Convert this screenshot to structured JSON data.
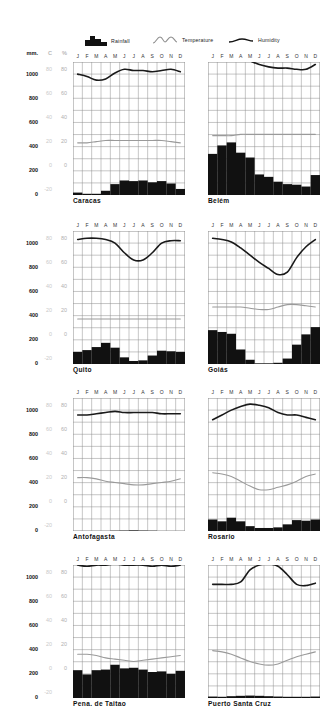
{
  "legend": {
    "rainfall_label": "Rainfall",
    "temperature_label": "Temperature",
    "humidity_label": "Humidity",
    "rainfall_icon": "rainfall-bars-icon",
    "temperature_icon": "temperature-curve-icon",
    "humidity_icon": "humidity-line-icon"
  },
  "axes": {
    "mm_header": "mm.",
    "c_header": "C",
    "pct_header": "%",
    "mm_ticks": [
      "1000",
      "800",
      "600",
      "400",
      "200",
      "0"
    ],
    "c_ticks": [
      "80",
      "60",
      "40",
      "20",
      "0",
      "-20"
    ],
    "pct_ticks": [
      "80",
      "60",
      "40",
      "20",
      "0"
    ],
    "months": [
      "J",
      "F",
      "M",
      "A",
      "M",
      "J",
      "J",
      "A",
      "S",
      "O",
      "N",
      "D"
    ]
  },
  "colors": {
    "rainfall": "#111111",
    "humidity": "#1a1a1a",
    "temperature": "#9a9a9a",
    "grid": "#8d8d8d",
    "frame": "#3a3a3a",
    "faint_text": "#c2c2c2"
  },
  "chart_data": [
    {
      "type": "bar",
      "title": "Caracas",
      "categories": [
        "J",
        "F",
        "M",
        "A",
        "M",
        "J",
        "J",
        "A",
        "S",
        "O",
        "N",
        "D"
      ],
      "xlabel": "",
      "ylabel": "mm. / C / %",
      "ylim": [
        0,
        1100
      ],
      "grid": true,
      "legend_position": "top",
      "series": [
        {
          "name": "Rainfall",
          "unit": "mm",
          "values": [
            20,
            10,
            10,
            35,
            90,
            120,
            115,
            120,
            105,
            115,
            95,
            50
          ]
        },
        {
          "name": "Temperature",
          "unit": "C",
          "values": [
            19,
            19,
            20,
            21,
            21,
            21,
            21,
            21,
            21,
            21,
            20,
            19
          ]
        },
        {
          "name": "Humidity",
          "unit": "%",
          "values": [
            76,
            74,
            71,
            72,
            77,
            80,
            79,
            79,
            78,
            79,
            80,
            78
          ]
        }
      ]
    },
    {
      "type": "bar",
      "title": "Belém",
      "categories": [
        "J",
        "F",
        "M",
        "A",
        "M",
        "J",
        "J",
        "A",
        "S",
        "O",
        "N",
        "D"
      ],
      "xlabel": "",
      "ylabel": "mm. / C / %",
      "ylim": [
        0,
        1100
      ],
      "grid": true,
      "legend_position": "top",
      "series": [
        {
          "name": "Rainfall",
          "unit": "mm",
          "values": [
            340,
            410,
            435,
            350,
            310,
            170,
            150,
            110,
            90,
            85,
            70,
            165
          ]
        },
        {
          "name": "Temperature",
          "unit": "C",
          "values": [
            25,
            25,
            25,
            26,
            26,
            26,
            26,
            26,
            26,
            26,
            26,
            26
          ]
        },
        {
          "name": "Humidity",
          "unit": "%",
          "values": [
            87,
            89,
            90,
            90,
            87,
            84,
            82,
            81,
            81,
            80,
            80,
            84
          ]
        }
      ]
    },
    {
      "type": "bar",
      "title": "Quito",
      "categories": [
        "J",
        "F",
        "M",
        "A",
        "M",
        "J",
        "J",
        "A",
        "S",
        "O",
        "N",
        "D"
      ],
      "xlabel": "",
      "ylabel": "mm. / C / %",
      "ylim": [
        0,
        1100
      ],
      "grid": true,
      "legend_position": "top",
      "series": [
        {
          "name": "Rainfall",
          "unit": "mm",
          "values": [
            100,
            115,
            140,
            175,
            135,
            55,
            25,
            30,
            70,
            110,
            105,
            100
          ]
        },
        {
          "name": "Temperature",
          "unit": "C",
          "values": [
            13,
            13,
            13,
            13,
            13,
            13,
            13,
            13,
            13,
            13,
            13,
            13
          ]
        },
        {
          "name": "Humidity",
          "unit": "%",
          "values": [
            79,
            80,
            80,
            79,
            76,
            68,
            62,
            62,
            68,
            76,
            78,
            78
          ]
        }
      ]
    },
    {
      "type": "bar",
      "title": "Goiás",
      "categories": [
        "J",
        "F",
        "M",
        "A",
        "M",
        "J",
        "J",
        "A",
        "S",
        "O",
        "N",
        "D"
      ],
      "xlabel": "",
      "ylabel": "mm. / C / %",
      "ylim": [
        0,
        1100
      ],
      "grid": true,
      "legend_position": "top",
      "series": [
        {
          "name": "Rainfall",
          "unit": "mm",
          "values": [
            280,
            265,
            250,
            120,
            35,
            5,
            5,
            10,
            45,
            160,
            245,
            305
          ]
        },
        {
          "name": "Temperature",
          "unit": "C",
          "values": [
            23,
            23,
            23,
            23,
            22,
            21,
            21,
            23,
            25,
            25,
            24,
            23
          ]
        },
        {
          "name": "Humidity",
          "unit": "%",
          "values": [
            80,
            79,
            77,
            72,
            66,
            60,
            55,
            50,
            52,
            64,
            73,
            79
          ]
        }
      ]
    },
    {
      "type": "bar",
      "title": "Antofagasta",
      "categories": [
        "J",
        "F",
        "M",
        "A",
        "M",
        "J",
        "J",
        "A",
        "S",
        "O",
        "N",
        "D"
      ],
      "xlabel": "",
      "ylabel": "mm. / C / %",
      "ylim": [
        0,
        1100
      ],
      "grid": true,
      "legend_position": "top",
      "series": [
        {
          "name": "Rainfall",
          "unit": "mm",
          "values": [
            0,
            0,
            0,
            0,
            2,
            3,
            5,
            3,
            2,
            0,
            0,
            0
          ]
        },
        {
          "name": "Temperature",
          "unit": "C",
          "values": [
            20,
            20,
            19,
            17,
            16,
            15,
            14,
            14,
            15,
            16,
            17,
            19
          ]
        },
        {
          "name": "Humidity",
          "unit": "%",
          "values": [
            72,
            72,
            73,
            74,
            75,
            74,
            74,
            74,
            74,
            73,
            73,
            73
          ]
        }
      ]
    },
    {
      "type": "bar",
      "title": "Rosario",
      "categories": [
        "J",
        "F",
        "M",
        "A",
        "M",
        "J",
        "J",
        "A",
        "S",
        "O",
        "N",
        "D"
      ],
      "xlabel": "",
      "ylabel": "mm. / C / %",
      "ylim": [
        0,
        1100
      ],
      "grid": true,
      "legend_position": "top",
      "series": [
        {
          "name": "Rainfall",
          "unit": "mm",
          "values": [
            95,
            80,
            110,
            80,
            40,
            25,
            25,
            30,
            55,
            90,
            85,
            95
          ]
        },
        {
          "name": "Temperature",
          "unit": "C",
          "values": [
            24,
            23,
            21,
            17,
            13,
            10,
            10,
            12,
            14,
            17,
            21,
            23
          ]
        },
        {
          "name": "Humidity",
          "unit": "%",
          "values": [
            68,
            72,
            76,
            79,
            81,
            80,
            78,
            74,
            72,
            72,
            70,
            68
          ]
        }
      ]
    },
    {
      "type": "bar",
      "title": "Pena. de Taitao",
      "categories": [
        "J",
        "F",
        "M",
        "A",
        "M",
        "J",
        "J",
        "A",
        "S",
        "O",
        "N",
        "D"
      ],
      "xlabel": "",
      "ylabel": "mm. / C / %",
      "ylim": [
        0,
        1100
      ],
      "grid": true,
      "legend_position": "top",
      "series": [
        {
          "name": "Rainfall",
          "unit": "mm",
          "values": [
            230,
            195,
            230,
            235,
            275,
            245,
            250,
            235,
            215,
            220,
            200,
            225
          ]
        },
        {
          "name": "Temperature",
          "unit": "C",
          "values": [
            12,
            12,
            11,
            9,
            8,
            7,
            6,
            7,
            8,
            9,
            10,
            11
          ]
        },
        {
          "name": "Humidity",
          "unit": "%",
          "values": [
            86,
            85,
            86,
            86,
            87,
            86,
            86,
            86,
            85,
            86,
            85,
            86
          ]
        }
      ]
    },
    {
      "type": "bar",
      "title": "Puerto Santa Cruz",
      "categories": [
        "J",
        "F",
        "M",
        "A",
        "M",
        "J",
        "J",
        "A",
        "S",
        "O",
        "N",
        "D"
      ],
      "xlabel": "",
      "ylabel": "mm. / C / %",
      "ylim": [
        0,
        1100
      ],
      "grid": true,
      "legend_position": "top",
      "series": [
        {
          "name": "Rainfall",
          "unit": "mm",
          "values": [
            12,
            10,
            15,
            18,
            20,
            18,
            15,
            12,
            10,
            10,
            10,
            12
          ]
        },
        {
          "name": "Temperature",
          "unit": "C",
          "values": [
            15,
            14,
            12,
            9,
            6,
            4,
            3,
            4,
            7,
            10,
            12,
            14
          ]
        },
        {
          "name": "Humidity",
          "unit": "%",
          "values": [
            70,
            70,
            70,
            72,
            82,
            86,
            87,
            85,
            78,
            70,
            69,
            71
          ]
        }
      ]
    }
  ]
}
